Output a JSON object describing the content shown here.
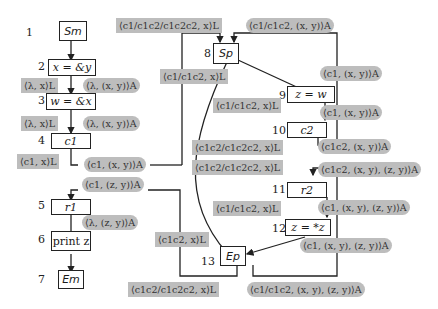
{
  "colors": {
    "label_fill": "#bdbdbd",
    "edge": "#222222",
    "node_border": "#222222",
    "background": "#ffffff"
  },
  "nodes": [
    {
      "id": 1,
      "number": "1",
      "text": "S_m",
      "display": "Sm"
    },
    {
      "id": 2,
      "number": "2",
      "text": "x = &y"
    },
    {
      "id": 3,
      "number": "3",
      "text": "w = &x"
    },
    {
      "id": 4,
      "number": "4",
      "text": "c1"
    },
    {
      "id": 5,
      "number": "5",
      "text": "r1"
    },
    {
      "id": 6,
      "number": "6",
      "text": "print z"
    },
    {
      "id": 7,
      "number": "7",
      "text": "E_m",
      "display": "Em"
    },
    {
      "id": 8,
      "number": "8",
      "text": "S_p",
      "display": "Sp"
    },
    {
      "id": 9,
      "number": "9",
      "text": "z = w"
    },
    {
      "id": 10,
      "number": "10",
      "text": "c2"
    },
    {
      "id": 11,
      "number": "11",
      "text": "r2"
    },
    {
      "id": 12,
      "number": "12",
      "text": "z = *z"
    },
    {
      "id": 13,
      "number": "13",
      "text": "E_p",
      "display": "Ep"
    }
  ],
  "labels": {
    "top_left_L": "⟨c1/c1c2/c1c2c2, x⟩L",
    "top_right_A": "⟨c1/c1c2, (x, y)⟩A",
    "n2_L": "⟨λ, x⟩L",
    "n2_A": "⟨λ, (x, y)⟩A",
    "n3_L": "⟨λ, x⟩L",
    "n3_A": "⟨λ, (x, y)⟩A",
    "n4_L": "⟨c1, x⟩L",
    "n4_A": "⟨c1, (x, y)⟩A",
    "ret1_A": "⟨c1, (z, y)⟩A",
    "n5_A": "⟨λ, (z, y)⟩A",
    "sp_L": "⟨c1/c1c2, x⟩L",
    "n9_L": "⟨c1/c1c2, x⟩L",
    "n9_A_right": "⟨c1, (x, y)⟩A",
    "n10_A_right": "⟨c1, (x, y)⟩A",
    "mid_L1": "⟨c1c2/c1c2c2, x⟩L",
    "mid_L2": "⟨c1c2/c1c2c2, x⟩L",
    "n10_A_out": "⟨c1c2, (x, y)⟩A",
    "n11_A_in": "⟨c1c2, (x, y), (z, y)⟩A",
    "n11_L": "⟨c1/c1c2, x⟩L",
    "n11_A": "⟨c1, (x, y), (z, y)⟩A",
    "n12_A": "⟨c1, (x, y), (z, y)⟩A",
    "ep_in_L": "⟨c1c2, x⟩L",
    "bottom_L": "⟨c1c2/c1c2c2, x⟩L",
    "bottom_A": "⟨c1/c1c2, (x, y), (z, y)⟩A"
  }
}
